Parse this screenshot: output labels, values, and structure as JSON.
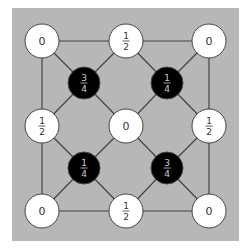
{
  "diagram": {
    "background": {
      "x": 12,
      "y": 8,
      "width": 227,
      "height": 233,
      "color": "#b7b7b7"
    },
    "colors": {
      "edge": "#444444",
      "white_fill": "#ffffff",
      "black_fill": "#000000",
      "white_text": "#333333",
      "black_text": "#cccccc",
      "stroke": "#444444"
    },
    "nodes": [
      {
        "id": "tl",
        "x": 42,
        "y": 41,
        "r": 17,
        "color": "white",
        "label": "0"
      },
      {
        "id": "tm",
        "x": 126,
        "y": 41,
        "r": 17,
        "color": "white",
        "label": "1/2",
        "num": "1",
        "den": "2"
      },
      {
        "id": "tr",
        "x": 209,
        "y": 41,
        "r": 17,
        "color": "white",
        "label": "0"
      },
      {
        "id": "ml",
        "x": 42,
        "y": 126,
        "r": 17,
        "color": "white",
        "label": "1/2",
        "num": "1",
        "den": "2"
      },
      {
        "id": "c",
        "x": 126,
        "y": 126,
        "r": 17,
        "color": "white",
        "label": "0"
      },
      {
        "id": "mr",
        "x": 209,
        "y": 126,
        "r": 17,
        "color": "white",
        "label": "1/2",
        "num": "1",
        "den": "2"
      },
      {
        "id": "bl",
        "x": 42,
        "y": 211,
        "r": 17,
        "color": "white",
        "label": "0"
      },
      {
        "id": "bm",
        "x": 126,
        "y": 211,
        "r": 17,
        "color": "white",
        "label": "1/2",
        "num": "1",
        "den": "2"
      },
      {
        "id": "br",
        "x": 209,
        "y": 211,
        "r": 17,
        "color": "white",
        "label": "0"
      },
      {
        "id": "b1",
        "x": 84,
        "y": 83,
        "r": 16,
        "color": "black",
        "label": "3/4",
        "num": "3",
        "den": "4"
      },
      {
        "id": "b2",
        "x": 167,
        "y": 83,
        "r": 16,
        "color": "black",
        "label": "1/4",
        "num": "1",
        "den": "4"
      },
      {
        "id": "b3",
        "x": 84,
        "y": 168,
        "r": 16,
        "color": "black",
        "label": "1/4",
        "num": "1",
        "den": "4"
      },
      {
        "id": "b4",
        "x": 167,
        "y": 168,
        "r": 16,
        "color": "black",
        "label": "3/4",
        "num": "3",
        "den": "4"
      }
    ],
    "edges": [
      [
        "tl",
        "tm"
      ],
      [
        "tm",
        "tr"
      ],
      [
        "tr",
        "mr"
      ],
      [
        "mr",
        "br"
      ],
      [
        "br",
        "bm"
      ],
      [
        "bm",
        "bl"
      ],
      [
        "bl",
        "ml"
      ],
      [
        "ml",
        "tl"
      ],
      [
        "tl",
        "b1"
      ],
      [
        "tm",
        "b1"
      ],
      [
        "ml",
        "b1"
      ],
      [
        "c",
        "b1"
      ],
      [
        "tr",
        "b2"
      ],
      [
        "tm",
        "b2"
      ],
      [
        "mr",
        "b2"
      ],
      [
        "c",
        "b2"
      ],
      [
        "bl",
        "b3"
      ],
      [
        "bm",
        "b3"
      ],
      [
        "ml",
        "b3"
      ],
      [
        "c",
        "b3"
      ],
      [
        "br",
        "b4"
      ],
      [
        "bm",
        "b4"
      ],
      [
        "mr",
        "b4"
      ],
      [
        "c",
        "b4"
      ]
    ]
  }
}
